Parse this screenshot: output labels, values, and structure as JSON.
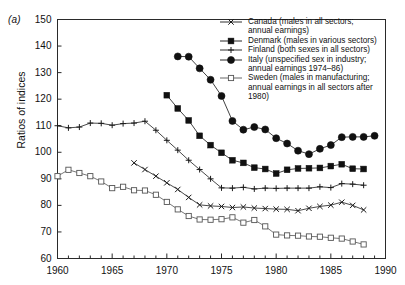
{
  "figure": {
    "panel_label": "(a)",
    "ylabel": "Ratios of indices"
  },
  "chart_data": {
    "type": "line",
    "title": "",
    "xlabel": "",
    "ylabel": "Ratios of indices",
    "xlim": [
      1960,
      1990
    ],
    "ylim": [
      60,
      150
    ],
    "xticks": [
      1960,
      1965,
      1970,
      1975,
      1980,
      1985,
      1990
    ],
    "yticks": [
      60,
      70,
      80,
      90,
      100,
      110,
      120,
      130,
      140,
      150
    ],
    "xtick_labels": [
      "1960",
      "1965",
      "1970",
      "1975",
      "1980",
      "1985",
      "1990"
    ],
    "ytick_labels": [
      "60",
      "70",
      "80",
      "90",
      "100",
      "110",
      "120",
      "130",
      "140",
      "150"
    ],
    "minor_xticks_every": 1,
    "grid": false,
    "legend_position": "top-right",
    "series": [
      {
        "name": "Canada (males in all sectors; annual earnings)",
        "short_name": "Canada",
        "marker": "cross-x",
        "color": "#1a1a1a",
        "x": [
          1967,
          1968,
          1969,
          1970,
          1971,
          1972,
          1973,
          1974,
          1975,
          1976,
          1977,
          1978,
          1979,
          1980,
          1981,
          1982,
          1983,
          1984,
          1985,
          1986,
          1987,
          1988
        ],
        "values": [
          96.0,
          93.5,
          91.0,
          88.5,
          86.0,
          83.0,
          80.2,
          79.8,
          79.6,
          79.2,
          79.4,
          79.0,
          78.8,
          78.6,
          78.5,
          78.0,
          78.9,
          79.6,
          80.1,
          81.2,
          80.0,
          78.3
        ]
      },
      {
        "name": "Denmark (males in various sectors)",
        "short_name": "Denmark",
        "marker": "filled-square",
        "color": "#111111",
        "x": [
          1970,
          1971,
          1972,
          1973,
          1974,
          1975,
          1976,
          1977,
          1978,
          1979,
          1980,
          1981,
          1982,
          1983,
          1984,
          1985,
          1986,
          1987,
          1988
        ],
        "values": [
          121.5,
          116.5,
          112.0,
          106.2,
          102.7,
          99.8,
          97.0,
          96.0,
          94.2,
          93.7,
          92.0,
          93.4,
          93.9,
          94.0,
          94.1,
          94.8,
          95.5,
          93.8,
          93.7
        ]
      },
      {
        "name": "Finland (both sexes in all sectors)",
        "short_name": "Finland",
        "marker": "plus",
        "color": "#1a1a1a",
        "x": [
          1960,
          1961,
          1962,
          1963,
          1964,
          1965,
          1966,
          1967,
          1968,
          1969,
          1970,
          1971,
          1972,
          1973,
          1974,
          1975,
          1976,
          1977,
          1978,
          1979,
          1980,
          1981,
          1982,
          1983,
          1984,
          1985,
          1986,
          1987,
          1988
        ],
        "values": [
          110.0,
          109.2,
          109.5,
          111.0,
          110.9,
          110.2,
          110.8,
          111.0,
          111.7,
          108.3,
          104.5,
          100.8,
          97.0,
          93.5,
          90.0,
          86.6,
          86.5,
          86.8,
          86.2,
          86.5,
          86.4,
          86.5,
          86.5,
          86.5,
          87.0,
          86.7,
          88.2,
          88.0,
          87.6
        ]
      },
      {
        "name": "Italy (unspecified sex in industry; annual earnings 1974-86)",
        "short_name": "Italy",
        "marker": "filled-circle",
        "color": "#111111",
        "x": [
          1971,
          1972,
          1973,
          1974,
          1975,
          1976,
          1977,
          1978,
          1979,
          1980,
          1981,
          1982,
          1983,
          1984,
          1985,
          1986,
          1987,
          1988,
          1989
        ],
        "values": [
          136.1,
          136.0,
          131.6,
          127.3,
          121.2,
          111.8,
          108.5,
          109.5,
          108.6,
          105.3,
          103.3,
          100.6,
          99.3,
          101.3,
          102.7,
          105.7,
          105.8,
          105.8,
          106.2
        ]
      },
      {
        "name": "Sweden (males in manufacturing; annual earnings in all sectors after 1980)",
        "short_name": "Sweden",
        "marker": "open-square",
        "color": "#555555",
        "x": [
          1960,
          1961,
          1962,
          1963,
          1964,
          1965,
          1966,
          1967,
          1968,
          1969,
          1970,
          1971,
          1972,
          1973,
          1974,
          1975,
          1976,
          1977,
          1978,
          1979,
          1980,
          1981,
          1982,
          1983,
          1984,
          1985,
          1986,
          1987,
          1988
        ],
        "values": [
          91.0,
          93.4,
          92.2,
          91.0,
          89.0,
          86.5,
          87.0,
          85.7,
          85.6,
          84.0,
          81.3,
          78.5,
          76.0,
          74.7,
          74.6,
          74.8,
          75.5,
          73.5,
          74.5,
          72.1,
          69.0,
          68.7,
          68.6,
          68.3,
          68.2,
          67.8,
          67.5,
          66.4,
          65.3
        ]
      }
    ]
  },
  "legend": {
    "entries": [
      {
        "marker": "cross-x",
        "line1": "Canada (males in all sectors;",
        "line2": "annual earnings)"
      },
      {
        "marker": "filled-square",
        "line1": "Denmark (males in various sectors)",
        "line2": ""
      },
      {
        "marker": "plus",
        "line1": "Finland (both sexes in all sectors)",
        "line2": ""
      },
      {
        "marker": "filled-circle",
        "line1": "Italy (unspecified sex in industry;",
        "line2": "annual earnings 1974–86)"
      },
      {
        "marker": "open-square",
        "line1": "Sweden (males in manufacturing;",
        "line2": "annual earnings in all sectors after",
        "line3": "1980)"
      }
    ]
  }
}
